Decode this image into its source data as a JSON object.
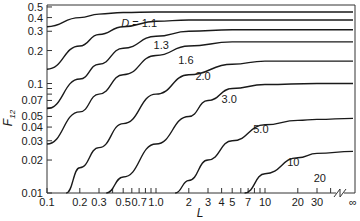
{
  "chart_data": {
    "type": "line",
    "title": "",
    "xlabel": "L",
    "ylabel": "F12",
    "xscale": "log",
    "yscale": "log",
    "xlim": [
      0.1,
      "∞"
    ],
    "ylim": [
      0.01,
      0.5
    ],
    "grid": false,
    "legend": "inline curve labels",
    "x_ticks": [
      "0.1",
      "0.2",
      "0.3",
      "0.5",
      "0.7",
      "1.0",
      "2",
      "3",
      "4",
      "5",
      "7",
      "10",
      "20",
      "30",
      "∞"
    ],
    "y_ticks": [
      "0.5",
      "0.4",
      "0.3",
      "0.2",
      "0.1",
      "0.07",
      "0.05",
      "0.04",
      "0.03",
      "0.02",
      "0.01"
    ],
    "x_axis_break": true,
    "series": [
      {
        "name": "D = 1.1",
        "label": "D = 1.1",
        "x": [
          0.1,
          0.2,
          0.3,
          0.5,
          1.0,
          2,
          5,
          10,
          30,
          "∞"
        ],
        "y": [
          0.33,
          0.4,
          0.43,
          0.445,
          0.45,
          0.45,
          0.45,
          0.45,
          0.45,
          0.45
        ]
      },
      {
        "name": "D = 1.3",
        "label": "1.3",
        "x": [
          0.1,
          0.2,
          0.3,
          0.5,
          1.0,
          2,
          5,
          10,
          30,
          "∞"
        ],
        "y": [
          0.135,
          0.22,
          0.28,
          0.33,
          0.37,
          0.38,
          0.38,
          0.38,
          0.38,
          0.38
        ]
      },
      {
        "name": "D = 1.6",
        "label": "1.6",
        "x": [
          0.1,
          0.2,
          0.3,
          0.5,
          1.0,
          2,
          5,
          10,
          30,
          "∞"
        ],
        "y": [
          0.059,
          0.11,
          0.15,
          0.21,
          0.27,
          0.3,
          0.31,
          0.31,
          0.31,
          0.31
        ]
      },
      {
        "name": "D = 2.0",
        "label": "2.0",
        "x": [
          0.1,
          0.2,
          0.3,
          0.5,
          1.0,
          2,
          5,
          10,
          30,
          "∞"
        ],
        "y": [
          0.028,
          0.055,
          0.08,
          0.12,
          0.18,
          0.22,
          0.24,
          0.24,
          0.24,
          0.24
        ]
      },
      {
        "name": "D = 3.0",
        "label": "3.0",
        "x": [
          0.15,
          0.2,
          0.3,
          0.5,
          1.0,
          2,
          5,
          10,
          30,
          "∞"
        ],
        "y": [
          0.01,
          0.017,
          0.026,
          0.043,
          0.08,
          0.12,
          0.15,
          0.16,
          0.16,
          0.16
        ]
      },
      {
        "name": "D = 5.0",
        "label": "5.0",
        "x": [
          0.35,
          0.5,
          1.0,
          2,
          3,
          5,
          10,
          30,
          "∞"
        ],
        "y": [
          0.01,
          0.014,
          0.028,
          0.05,
          0.07,
          0.09,
          0.098,
          0.1,
          0.1
        ]
      },
      {
        "name": "D = 10",
        "label": "10",
        "x": [
          1.5,
          2,
          3,
          5,
          10,
          20,
          30,
          "∞"
        ],
        "y": [
          0.01,
          0.013,
          0.02,
          0.03,
          0.042,
          0.046,
          0.047,
          0.048
        ]
      },
      {
        "name": "D = 20",
        "label": "20",
        "x": [
          6.5,
          10,
          20,
          30,
          "∞"
        ],
        "y": [
          0.01,
          0.015,
          0.021,
          0.023,
          0.024
        ]
      }
    ]
  },
  "axes": {
    "x_title": "L",
    "y_title_main": "F",
    "y_title_sub": "12"
  }
}
